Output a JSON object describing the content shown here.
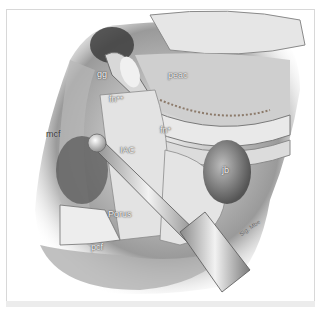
{
  "figure": {
    "labels": {
      "gg": "gg",
      "fn_star_star": "fn**",
      "peac": "peac",
      "mcf": "mcf",
      "iac": "IAC",
      "fn_star": "fn*",
      "jb": "jb",
      "porus": "Porus",
      "pcf": "pcf",
      "signature": "Sig. Mbe"
    }
  }
}
